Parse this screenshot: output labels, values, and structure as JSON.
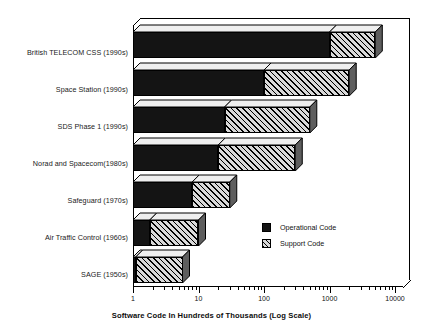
{
  "chart_data": {
    "type": "bar",
    "orientation": "horizontal",
    "stacked": true,
    "title": "",
    "xlabel": "Software Code In Hundreds of Thousands (Log Scale)",
    "ylabel": "",
    "xscale": "log",
    "xlim": [
      1,
      10000
    ],
    "xticks": [
      1,
      10,
      100,
      1000,
      10000
    ],
    "xtick_labels": [
      "1",
      "10",
      "100",
      "1000",
      "10000"
    ],
    "grid": false,
    "legend_position": "inside-center-right",
    "categories": [
      "British TELECOM CSS (1990s)",
      "Space Station (1990s)",
      "SDS Phase 1 (1990s)",
      "Norad and Spacecom(1980s)",
      "Safeguard (1970s)",
      "Air Traffic Control (1960s)",
      "SAGE (1950s)"
    ],
    "series": [
      {
        "name": "Operational Code",
        "color": "#141414",
        "values": [
          1000,
          100,
          25,
          20,
          8,
          1.8,
          1.1
        ]
      },
      {
        "name": "Support Code",
        "color": "#d8d8d8",
        "hatch": "diagonal",
        "values": [
          5000,
          2000,
          500,
          300,
          30,
          10,
          5.7
        ]
      }
    ],
    "legend": [
      {
        "label": "Operational Code",
        "swatch": "solid-black"
      },
      {
        "label": "Support Code",
        "swatch": "diagonal-hatch"
      }
    ]
  },
  "axis": {
    "x_title": "Software Code In Hundreds of Thousands (Log Scale)",
    "tick_labels": [
      "1",
      "10",
      "100",
      "1000",
      "10000"
    ]
  },
  "categories": {
    "items": [
      {
        "label": "British TELECOM CSS (1990s)"
      },
      {
        "label": "Space Station (1990s)"
      },
      {
        "label": "SDS Phase 1 (1990s)"
      },
      {
        "label": "Norad and Spacecom(1980s)"
      },
      {
        "label": "Safeguard (1970s)"
      },
      {
        "label": "Air Traffic Control (1960s)"
      },
      {
        "label": "SAGE (1950s)"
      }
    ]
  },
  "legend": {
    "items": [
      {
        "label": "Operational Code"
      },
      {
        "label": "Support Code"
      }
    ]
  }
}
